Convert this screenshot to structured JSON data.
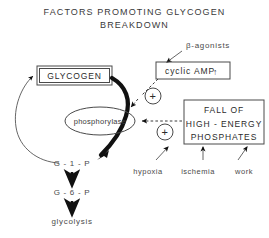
{
  "title": {
    "line1": "FACTORS  PROMOTING  GLYCOGEN",
    "line2": "BREAKDOWN"
  },
  "nodes": {
    "beta_agonists": "β-agonists",
    "cyclic_amp": "cyclic  AMP",
    "cyclic_amp_arrow": "↑",
    "glycogen": "GLYCOGEN",
    "phosphorylase": "phosphorylase",
    "fall_line1": "FALL  OF",
    "fall_line2": "HIGH - ENERGY",
    "fall_line3": "PHOSPHATES",
    "hypoxia": "hypoxia",
    "ischemia": "ischemia",
    "work": "work",
    "g1p": "G - 1 - P",
    "g6p": "G - 6 - P",
    "glycolysis": "glycolysis",
    "plus_upper": "+",
    "plus_lower": "+"
  },
  "colors": {
    "ink": "#2b2b2b",
    "line": "#555555",
    "thick_line": "#111111",
    "background": "#ffffff"
  }
}
